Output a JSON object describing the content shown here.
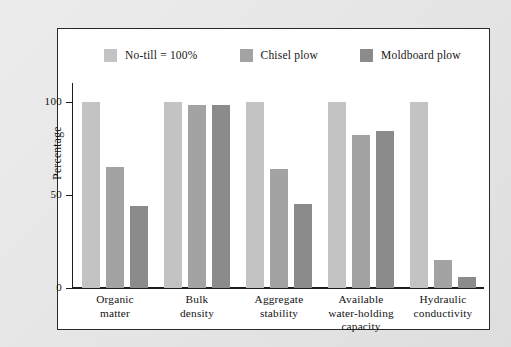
{
  "figure": {
    "background_color": "#e8e8e8",
    "plot_background_color": "#ffffff",
    "frame_color": "#2a2a2a"
  },
  "legend": {
    "position": "top-left",
    "entries": [
      {
        "label": "No-till = 100%",
        "color": "#c3c3c3",
        "swatch_name": "legend-swatch-no-till"
      },
      {
        "label": "Chisel plow",
        "color": "#a3a3a3",
        "swatch_name": "legend-swatch-chisel-plow"
      },
      {
        "label": "Moldboard plow",
        "color": "#8b8b8b",
        "swatch_name": "legend-swatch-moldboard-plow"
      }
    ]
  },
  "axes": {
    "y_title": "Percentage",
    "y_ticks": [
      "100",
      "50",
      "0"
    ],
    "y_tick_values": [
      100,
      50,
      0
    ]
  },
  "chart_data": {
    "type": "bar",
    "title": "",
    "xlabel": "",
    "ylabel": "Percentage",
    "ylim": [
      0,
      110
    ],
    "grid": false,
    "legend_position": "top-left",
    "categories": [
      "Organic matter",
      "Bulk density",
      "Aggregate stability",
      "Available water-holding capacity",
      "Hydraulic conductivity"
    ],
    "category_lines": [
      [
        "Organic",
        "matter"
      ],
      [
        "Bulk",
        "density"
      ],
      [
        "Aggregate",
        "stability"
      ],
      [
        "Available",
        "water-holding",
        "capacity"
      ],
      [
        "Hydraulic",
        "conductivity"
      ]
    ],
    "series": [
      {
        "name": "No-till = 100%",
        "color": "#c3c3c3",
        "values": [
          100,
          100,
          100,
          100,
          100
        ]
      },
      {
        "name": "Chisel plow",
        "color": "#a3a3a3",
        "values": [
          65,
          98,
          64,
          82,
          15
        ]
      },
      {
        "name": "Moldboard plow",
        "color": "#8b8b8b",
        "values": [
          44,
          98,
          45,
          84,
          6
        ]
      }
    ]
  }
}
